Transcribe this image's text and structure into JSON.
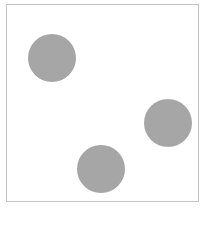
{
  "canvas": {
    "border_color": "#c4c4c4",
    "background": "#ffffff"
  },
  "circles": [
    {
      "cx": 52,
      "cy": 58,
      "r": 24,
      "color": "#a6a6a6"
    },
    {
      "cx": 168,
      "cy": 123,
      "r": 24,
      "color": "#a6a6a6"
    },
    {
      "cx": 101,
      "cy": 169,
      "r": 24,
      "color": "#a6a6a6"
    }
  ]
}
